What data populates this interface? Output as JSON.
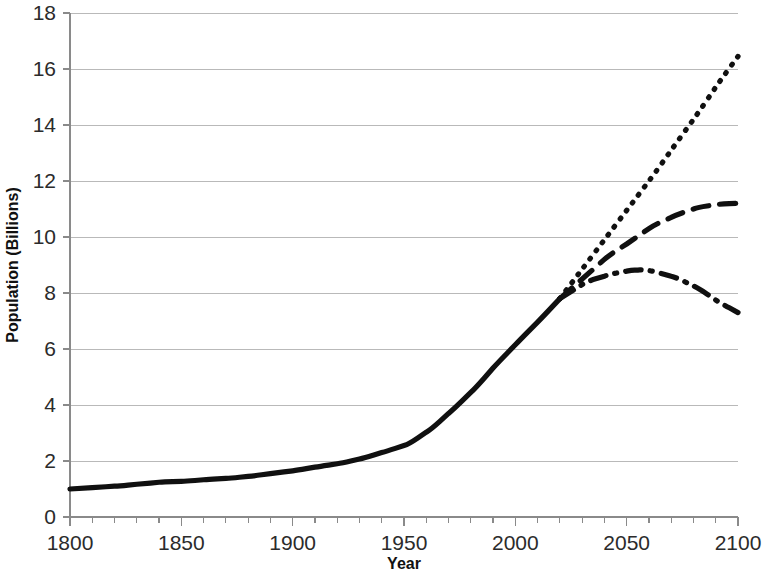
{
  "chart_data": {
    "type": "line",
    "title": "",
    "xlabel": "Year",
    "ylabel": "Population (Billions)",
    "xlim": [
      1800,
      2100
    ],
    "ylim": [
      0,
      18
    ],
    "x_ticks": [
      1800,
      1850,
      1900,
      1950,
      2000,
      2050,
      2100
    ],
    "x_tick_labels": [
      "1800",
      "1850",
      "1900",
      "1950",
      "2000",
      "2050",
      "2100"
    ],
    "x_minor_tick_step": 10,
    "y_ticks": [
      0,
      2,
      4,
      6,
      8,
      10,
      12,
      14,
      16,
      18
    ],
    "y_tick_labels": [
      "0",
      "2",
      "4",
      "6",
      "8",
      "10",
      "12",
      "14",
      "16",
      "18"
    ],
    "grid": "horizontal",
    "legend": "none",
    "line_color": "#101010",
    "grid_color": "#b9b9b9",
    "axis_color": "#8a8a8a",
    "background_color": "#ffffff",
    "series": [
      {
        "name": "Historical population",
        "style": "solid",
        "dash": "none",
        "width": 5.2,
        "x": [
          1800,
          1810,
          1820,
          1830,
          1840,
          1850,
          1860,
          1870,
          1880,
          1890,
          1900,
          1910,
          1920,
          1930,
          1940,
          1950,
          1960,
          1970,
          1980,
          1990,
          2000,
          2010,
          2020
        ],
        "values": [
          1.0,
          1.05,
          1.1,
          1.17,
          1.24,
          1.27,
          1.33,
          1.38,
          1.45,
          1.55,
          1.65,
          1.78,
          1.9,
          2.07,
          2.3,
          2.55,
          3.03,
          3.7,
          4.45,
          5.32,
          6.15,
          6.96,
          7.8
        ]
      },
      {
        "name": "High projection",
        "style": "dotted",
        "dash": "1,9",
        "width": 5.2,
        "x": [
          2020,
          2030,
          2040,
          2050,
          2060,
          2070,
          2080,
          2090,
          2100
        ],
        "values": [
          7.8,
          8.85,
          9.9,
          10.95,
          12.0,
          13.1,
          14.2,
          15.35,
          16.45
        ]
      },
      {
        "name": "Medium projection",
        "style": "dashed",
        "dash": "16,11",
        "width": 5.2,
        "x": [
          2020,
          2030,
          2040,
          2050,
          2060,
          2070,
          2080,
          2090,
          2100
        ],
        "values": [
          7.8,
          8.5,
          9.2,
          9.75,
          10.3,
          10.7,
          11.0,
          11.15,
          11.2
        ]
      },
      {
        "name": "Low projection",
        "style": "dash-dot",
        "dash": "16,9,2,9",
        "width": 5.2,
        "x": [
          2020,
          2030,
          2040,
          2050,
          2055,
          2060,
          2070,
          2080,
          2090,
          2100
        ],
        "values": [
          7.8,
          8.3,
          8.6,
          8.78,
          8.82,
          8.8,
          8.6,
          8.25,
          7.75,
          7.3
        ]
      }
    ]
  },
  "figure": {
    "plot_left": 70,
    "plot_right": 738,
    "plot_top": 13,
    "plot_bottom": 517,
    "xlabel_x": 404,
    "xlabel_y": 569,
    "ylabel_x": 18,
    "ylabel_y": 265
  }
}
